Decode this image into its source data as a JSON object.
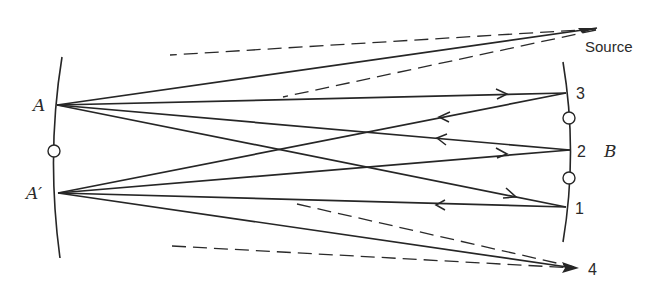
{
  "figure": {
    "labels": {
      "mirror_a_point_top": "A",
      "mirror_a_point_bottom": "A′",
      "mirror_b": "B",
      "spot_1": "1",
      "spot_2": "2",
      "spot_3": "3",
      "output": "4",
      "source": "Source"
    },
    "colors": {
      "line": "#262626",
      "background": "#ffffff"
    },
    "rays": [
      {
        "from": "Source",
        "to": "A",
        "style": "solid"
      },
      {
        "from": "A",
        "to": "3",
        "style": "solid",
        "arrow": "right"
      },
      {
        "from": "3",
        "to": "A′",
        "style": "solid",
        "arrow": "left"
      },
      {
        "from": "A′",
        "to": "2",
        "style": "solid",
        "arrow": "right"
      },
      {
        "from": "2",
        "to": "A",
        "style": "solid",
        "arrow": "left"
      },
      {
        "from": "A",
        "to": "1",
        "style": "solid",
        "arrow": "right"
      },
      {
        "from": "1",
        "to": "A′",
        "style": "solid",
        "arrow": "left"
      },
      {
        "from": "A′",
        "to": "4",
        "style": "solid",
        "arrow": "right"
      },
      {
        "from": "Source",
        "to": "beam-edge-upper",
        "style": "dashed"
      },
      {
        "from": "Source",
        "to": "beam-edge-lower",
        "style": "dashed"
      },
      {
        "from": "beam-edge-upper",
        "to": "4",
        "style": "dashed"
      },
      {
        "from": "beam-edge-lower",
        "to": "4",
        "style": "dashed"
      }
    ]
  }
}
